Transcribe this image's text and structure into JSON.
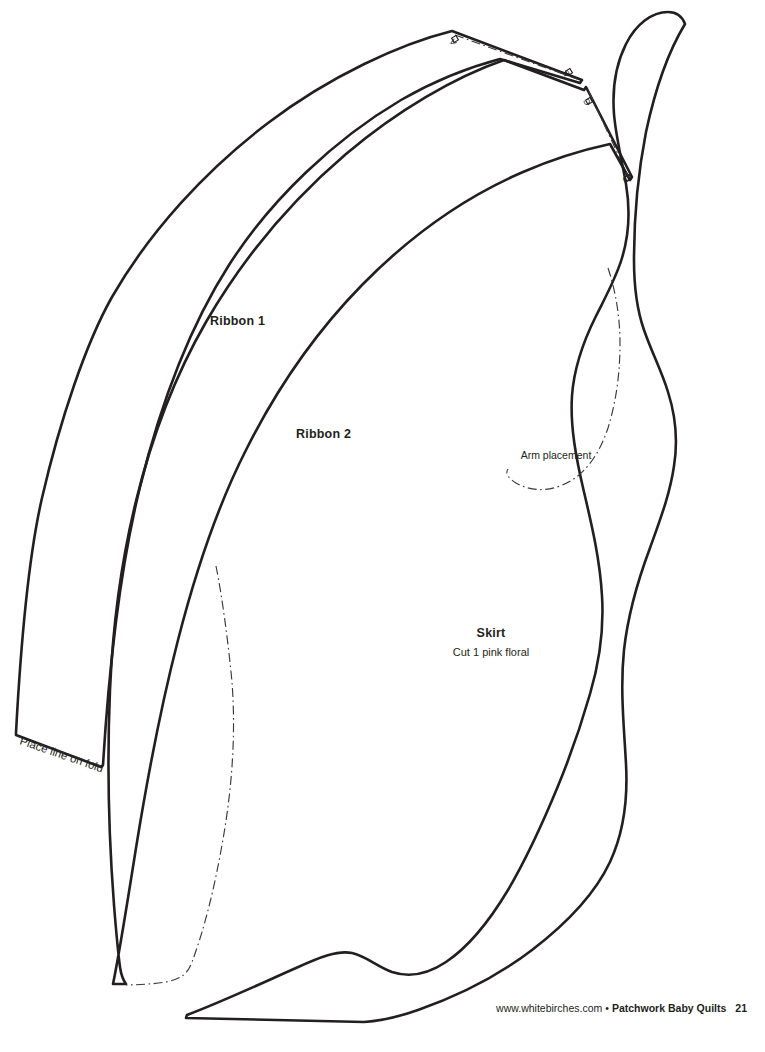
{
  "page": {
    "kind": "sewing-pattern-template-sheet",
    "background_color": "#ffffff",
    "line_color": "#231f20",
    "width": 765,
    "height": 1052
  },
  "pieces": [
    {
      "id": "ribbon-1",
      "label": "Ribbon 1",
      "label_x": 210,
      "label_y": 325,
      "sublabel": ""
    },
    {
      "id": "ribbon-2",
      "label": "Ribbon 2",
      "label_x": 296,
      "label_y": 438,
      "sublabel": ""
    },
    {
      "id": "skirt",
      "label": "Skirt",
      "label_x": 491,
      "label_y": 637,
      "sublabel": "Cut 1 pink floral",
      "sublabel_x": 491,
      "sublabel_y": 655
    }
  ],
  "notations": [
    {
      "id": "arm-placement",
      "text": "Arm placement",
      "x": 556,
      "y": 459,
      "rotation": 0
    },
    {
      "id": "place-line-on-fold",
      "text": "Place line on fold",
      "x": 19,
      "y": 744,
      "rotation": 12
    }
  ],
  "corner_labels": [
    {
      "id": "corner-a",
      "text": "A",
      "x": 457,
      "y": 43,
      "rotation": -122
    },
    {
      "id": "corner-b",
      "text": "B",
      "x": 570,
      "y": 74,
      "rotation": -122
    },
    {
      "id": "corner-c",
      "text": "C",
      "x": 591,
      "y": 103,
      "rotation": -122
    },
    {
      "id": "corner-d",
      "text": "D",
      "x": 630,
      "y": 180,
      "rotation": -122
    }
  ],
  "footer": {
    "site": "www.whitebirches.com",
    "separator": "•",
    "book_title": "Patchwork Baby Quilts",
    "page_number": "21"
  }
}
